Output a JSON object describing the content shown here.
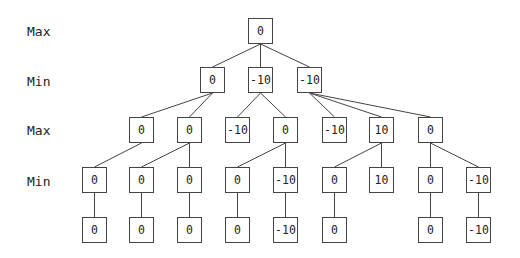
{
  "diagram": {
    "row_labels": [
      {
        "text": "Max",
        "y": 31
      },
      {
        "text": "Min",
        "y": 81
      },
      {
        "text": "Max",
        "y": 130
      },
      {
        "text": "Min",
        "y": 181
      }
    ],
    "nodes": [
      {
        "id": "r",
        "value": "0",
        "x": 248,
        "y": 18
      },
      {
        "id": "a",
        "value": "0",
        "x": 200,
        "y": 67
      },
      {
        "id": "b",
        "value": "-10",
        "x": 248,
        "y": 67
      },
      {
        "id": "c",
        "value": "-10",
        "x": 297,
        "y": 67
      },
      {
        "id": "a1",
        "value": "0",
        "x": 129,
        "y": 117
      },
      {
        "id": "a2",
        "value": "0",
        "x": 177,
        "y": 117
      },
      {
        "id": "b1",
        "value": "-10",
        "x": 225,
        "y": 117
      },
      {
        "id": "b2",
        "value": "0",
        "x": 273,
        "y": 117
      },
      {
        "id": "c1",
        "value": "-10",
        "x": 322,
        "y": 117
      },
      {
        "id": "c2",
        "value": "10",
        "x": 369,
        "y": 117
      },
      {
        "id": "c3",
        "value": "0",
        "x": 418,
        "y": 117
      },
      {
        "id": "a1x",
        "value": "0",
        "x": 82,
        "y": 167
      },
      {
        "id": "a2x",
        "value": "0",
        "x": 129,
        "y": 167
      },
      {
        "id": "a2y",
        "value": "0",
        "x": 177,
        "y": 167
      },
      {
        "id": "b2x",
        "value": "0",
        "x": 225,
        "y": 167
      },
      {
        "id": "b2y",
        "value": "-10",
        "x": 273,
        "y": 167
      },
      {
        "id": "c2x",
        "value": "0",
        "x": 322,
        "y": 167
      },
      {
        "id": "c2y",
        "value": "10",
        "x": 369,
        "y": 167
      },
      {
        "id": "c3x",
        "value": "0",
        "x": 418,
        "y": 167
      },
      {
        "id": "c3y",
        "value": "-10",
        "x": 466,
        "y": 167
      },
      {
        "id": "l1",
        "value": "0",
        "x": 82,
        "y": 217
      },
      {
        "id": "l2",
        "value": "0",
        "x": 129,
        "y": 217
      },
      {
        "id": "l3",
        "value": "0",
        "x": 177,
        "y": 217
      },
      {
        "id": "l4",
        "value": "0",
        "x": 225,
        "y": 217
      },
      {
        "id": "l5",
        "value": "-10",
        "x": 273,
        "y": 217
      },
      {
        "id": "l6",
        "value": "0",
        "x": 322,
        "y": 217
      },
      {
        "id": "l7",
        "value": "0",
        "x": 418,
        "y": 217
      },
      {
        "id": "l8",
        "value": "-10",
        "x": 466,
        "y": 217
      }
    ],
    "edges": [
      [
        "r",
        "a"
      ],
      [
        "r",
        "b"
      ],
      [
        "r",
        "c"
      ],
      [
        "a",
        "a1"
      ],
      [
        "a",
        "a2"
      ],
      [
        "b",
        "b1"
      ],
      [
        "b",
        "b2"
      ],
      [
        "c",
        "c1"
      ],
      [
        "c",
        "c2"
      ],
      [
        "c",
        "c3"
      ],
      [
        "a1",
        "a1x"
      ],
      [
        "a2",
        "a2x"
      ],
      [
        "a2",
        "a2y"
      ],
      [
        "b2",
        "b2x"
      ],
      [
        "b2",
        "b2y"
      ],
      [
        "c2",
        "c2x"
      ],
      [
        "c2",
        "c2y"
      ],
      [
        "c3",
        "c3x"
      ],
      [
        "c3",
        "c3y"
      ],
      [
        "a1x",
        "l1"
      ],
      [
        "a2x",
        "l2"
      ],
      [
        "a2y",
        "l3"
      ],
      [
        "b2x",
        "l4"
      ],
      [
        "b2y",
        "l5"
      ],
      [
        "c2x",
        "l6"
      ],
      [
        "c3x",
        "l7"
      ],
      [
        "c3y",
        "l8"
      ]
    ],
    "colors": {
      "stroke": "#444444",
      "text": "#222222",
      "background": "#ffffff"
    }
  }
}
